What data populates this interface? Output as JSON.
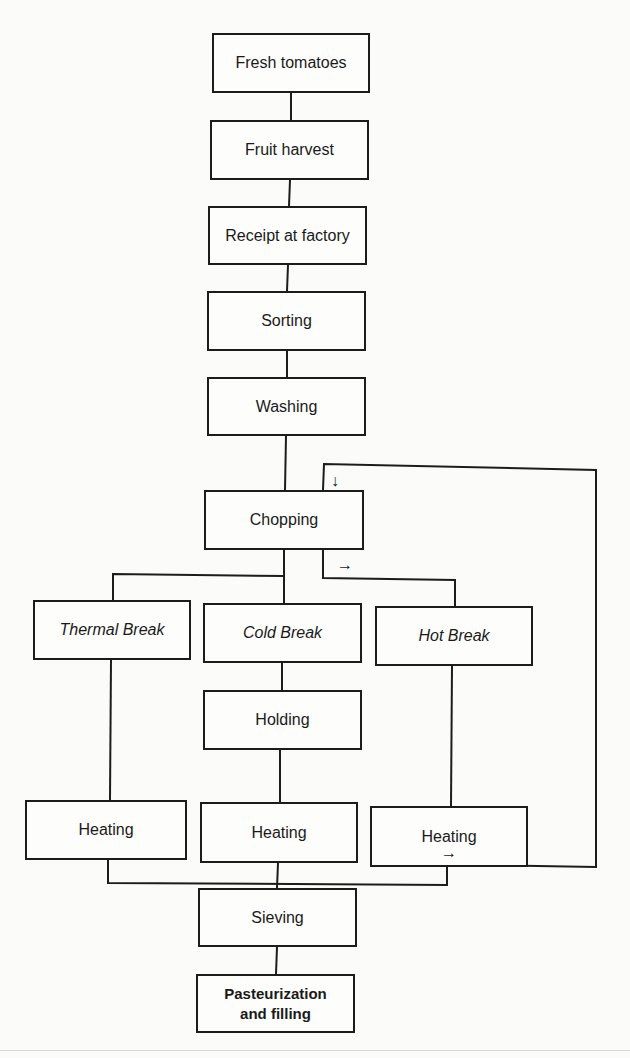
{
  "diagram": {
    "type": "process-flowchart",
    "nodes": [
      {
        "id": "fresh",
        "label": "Fresh tomatoes",
        "style": "normal"
      },
      {
        "id": "harvest",
        "label": "Fruit harvest",
        "style": "normal"
      },
      {
        "id": "receipt",
        "label": "Receipt at factory",
        "style": "normal"
      },
      {
        "id": "sorting",
        "label": "Sorting",
        "style": "normal"
      },
      {
        "id": "washing",
        "label": "Washing",
        "style": "normal"
      },
      {
        "id": "chopping",
        "label": "Chopping",
        "style": "normal"
      },
      {
        "id": "thermal",
        "label": "Thermal Break",
        "style": "italic"
      },
      {
        "id": "cold",
        "label": "Cold Break",
        "style": "italic"
      },
      {
        "id": "hot",
        "label": "Hot Break",
        "style": "italic"
      },
      {
        "id": "holding",
        "label": "Holding",
        "style": "normal"
      },
      {
        "id": "heating1",
        "label": "Heating",
        "style": "normal"
      },
      {
        "id": "heating2",
        "label": "Heating",
        "style": "normal"
      },
      {
        "id": "heating3",
        "label": "Heating",
        "style": "normal"
      },
      {
        "id": "sieving",
        "label": "Sieving",
        "style": "normal"
      },
      {
        "id": "pasteurization",
        "label": "Pasteurization and filling",
        "style": "bold"
      }
    ],
    "edges": [
      [
        "fresh",
        "harvest"
      ],
      [
        "harvest",
        "receipt"
      ],
      [
        "receipt",
        "sorting"
      ],
      [
        "sorting",
        "washing"
      ],
      [
        "washing",
        "chopping"
      ],
      [
        "chopping",
        "thermal"
      ],
      [
        "chopping",
        "cold"
      ],
      [
        "chopping",
        "hot"
      ],
      [
        "cold",
        "holding"
      ],
      [
        "holding",
        "heating2"
      ],
      [
        "thermal",
        "heating1"
      ],
      [
        "hot",
        "heating3"
      ],
      [
        "heating1",
        "sieving"
      ],
      [
        "heating2",
        "sieving"
      ],
      [
        "heating3",
        "sieving"
      ],
      [
        "heating3",
        "chopping",
        "recirculation loop"
      ]
    ],
    "arrows": {
      "down": "↓",
      "right": "→"
    }
  }
}
